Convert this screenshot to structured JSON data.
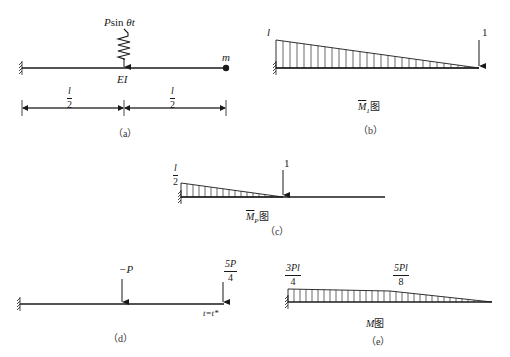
{
  "figure": {
    "panels": [
      {
        "id": "a",
        "caption": "（a）",
        "force_label": "Psin θt",
        "stiffness_label": "EI",
        "mass_label": "m",
        "dimension_left": {
          "num": "l",
          "den": "2"
        },
        "dimension_right": {
          "num": "l",
          "den": "2"
        }
      },
      {
        "id": "b",
        "caption": "（b）",
        "max_label": "l",
        "load_label": "1",
        "diagram_label": {
          "m": "M",
          "sub": "1",
          "suffix": "图"
        }
      },
      {
        "id": "c",
        "caption": "（c）",
        "max_label": {
          "num": "l",
          "den": "2"
        },
        "load_label": "1",
        "diagram_label": {
          "m": "M",
          "sub": "P",
          "suffix": "图"
        }
      },
      {
        "id": "d",
        "caption": "（d）",
        "load_mid_label": "−P",
        "load_end_label": {
          "num": "5P",
          "den": "4"
        },
        "time_label": "t=t*"
      },
      {
        "id": "e",
        "caption": "（e）",
        "value_left": {
          "num": "3Pl",
          "den": "4"
        },
        "value_mid": {
          "num": "5Pl",
          "den": "8"
        },
        "diagram_label": {
          "m": "M",
          "suffix": "图"
        }
      }
    ]
  },
  "colors": {
    "line": "#1a1a1a",
    "hatch": "#2a2a2a",
    "background": "#ffffff"
  }
}
